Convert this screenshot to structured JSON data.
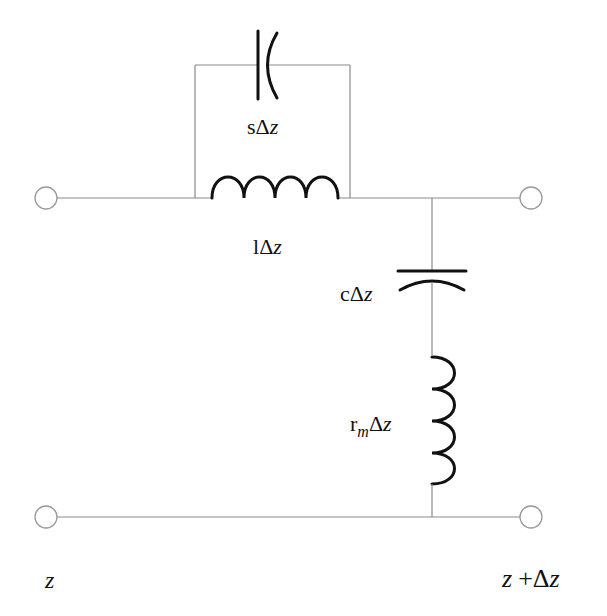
{
  "diagram": {
    "type": "circuit",
    "components": [
      {
        "id": "series-capacitor",
        "kind": "capacitor",
        "label": {
          "coef": "s",
          "delta": "Δ",
          "var": "z"
        }
      },
      {
        "id": "series-inductor",
        "kind": "inductor",
        "label": {
          "coef": "l",
          "delta": "Δ",
          "var": "z"
        }
      },
      {
        "id": "shunt-capacitor",
        "kind": "capacitor",
        "label": {
          "coef": "c",
          "delta": "Δ",
          "var": "z"
        }
      },
      {
        "id": "shunt-inductor",
        "kind": "inductor",
        "label": {
          "coef": "r",
          "sub": "m",
          "delta": "Δ",
          "var": "z"
        }
      }
    ],
    "terminals": {
      "left_label": "z",
      "right_label": {
        "var": "z",
        "plus": "+",
        "delta": "Δ",
        "var2": "z"
      }
    },
    "colors": {
      "wire": "#8a8a8a",
      "element": "#111111",
      "terminal": "#9a9a9a"
    }
  }
}
